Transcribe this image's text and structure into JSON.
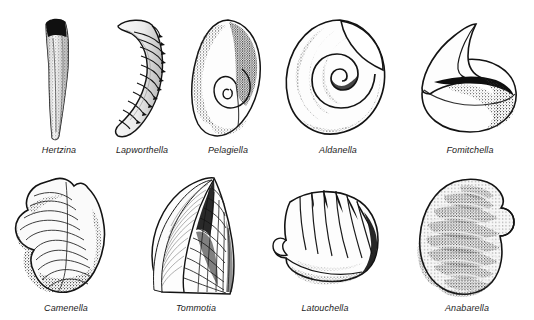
{
  "plate": {
    "background_color": "#ffffff",
    "ink_color": "#1a1a1a",
    "width": 534,
    "height": 320,
    "rows": 2,
    "columns": 5
  },
  "specimens": [
    {
      "id": "hertzina",
      "label": "Hertzina",
      "row": 1,
      "column": 1,
      "shape": "slender-curved-conical-element",
      "notes": "narrow elongate gently curved cusp, dark solid apex at top, stippled shading along shaft"
    },
    {
      "id": "lapworthella",
      "label": "Lapworthella",
      "row": 1,
      "column": 2,
      "shape": "curved-segmented-cone",
      "notes": "hook-like curved sclerite with transverse ribs and serrate dark outer margin"
    },
    {
      "id": "pelagiella",
      "label": "Pelagiella",
      "row": 1,
      "column": 3,
      "shape": "asymmetric-coiled-shell",
      "notes": "broad ovate shell with small tight spiral coil low on the body, heavy stipple on left and right flanks"
    },
    {
      "id": "aldanella",
      "label": "Aldanella",
      "row": 1,
      "column": 4,
      "shape": "planispiral-coiled-shell",
      "notes": "tightly coiled gastropod-like shell with prominent central whorl spiral and flared aperture upper right"
    },
    {
      "id": "fomitchella",
      "label": "Fomitchella",
      "row": 1,
      "column": 5,
      "shape": "cap-shell-with-recurved-apex",
      "notes": "rounded globose body with a sharp up-curving pointed apex, dense dark shading beneath the hood"
    },
    {
      "id": "camenella",
      "label": "Camenella",
      "row": 2,
      "column": 1,
      "shape": "irregular-lobed-sclerite",
      "notes": "lumpy asymmetric sclerite with concentric growth lines and dark stippled margins"
    },
    {
      "id": "tommotia",
      "label": "Tommotia",
      "row": 2,
      "column": 2,
      "shape": "pointed-sail-sclerite",
      "notes": "tall pointed sclerite, fine striations on left face and cross-hatched grid ornament on right face"
    },
    {
      "id": "latouchella",
      "label": "Latouchella",
      "row": 2,
      "column": 3,
      "shape": "ribbed-cap-shell",
      "notes": "fan-shaped cap shell with radiating comarginal ribs and a small recurved hook at the left apex"
    },
    {
      "id": "anabarella",
      "label": "Anabarella",
      "row": 2,
      "column": 4,
      "shape": "banded-laterally-compressed-shell",
      "notes": "stippled shell with strong oblique growth bands and a notch on the upper right margin"
    }
  ]
}
